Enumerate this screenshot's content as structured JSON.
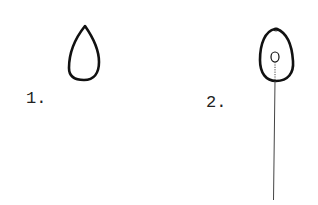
{
  "figure": {
    "items": [
      {
        "number": "1.",
        "description": "Simple teardrop-shaped outline"
      },
      {
        "number": "2.",
        "description": "Egg-shaped outline with small inner oval and long straight stalk extending downward"
      }
    ],
    "stroke_color": "#111111",
    "background": "#ffffff"
  }
}
